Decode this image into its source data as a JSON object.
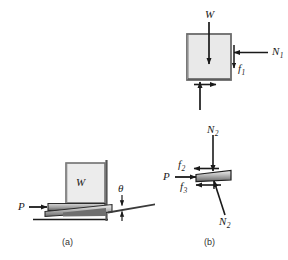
{
  "figure": {
    "type": "free-body-diagram",
    "background_color": "#ffffff",
    "stroke_color": "#1a1a1a",
    "block_fill": "#e8e8e8",
    "wedge_fill_light": "#d4d4d4",
    "wedge_fill_dark": "#6e6e6e"
  },
  "panels": [
    {
      "id": "a",
      "caption": "(a)"
    },
    {
      "id": "b",
      "caption": "(b)"
    }
  ],
  "panel_a": {
    "caption": "(a)",
    "labels": {
      "weight": "W",
      "applied_force": "P",
      "angle": "θ"
    },
    "elements": [
      {
        "name": "block",
        "label": "W"
      },
      {
        "name": "wedge",
        "label": ""
      },
      {
        "name": "wall",
        "label": ""
      },
      {
        "name": "ground",
        "label": ""
      },
      {
        "name": "applied-force-arrow",
        "label": "P"
      },
      {
        "name": "wedge-angle",
        "label": "θ"
      }
    ]
  },
  "panel_b": {
    "caption": "(b)",
    "block_fbd": {
      "weight_label": "W",
      "normal_label": "N",
      "normal_sub": "1",
      "friction_label": "f",
      "friction_sub": "1"
    },
    "wedge_fbd": {
      "applied_force_label": "P",
      "normal_top_label": "N",
      "normal_top_sub": "2",
      "normal_bottom_label": "N",
      "normal_bottom_sub": "2",
      "friction_top_label": "f",
      "friction_top_sub": "2",
      "friction_bottom_label": "f",
      "friction_bottom_sub": "3"
    }
  },
  "force_labels": {
    "W": "W",
    "P": "P",
    "N1_base": "N",
    "N1_sub": "1",
    "N2_base": "N",
    "N2_sub": "2",
    "f1_base": "f",
    "f1_sub": "1",
    "f2_base": "f",
    "f2_sub": "2",
    "f3_base": "f",
    "f3_sub": "3",
    "theta": "θ"
  }
}
